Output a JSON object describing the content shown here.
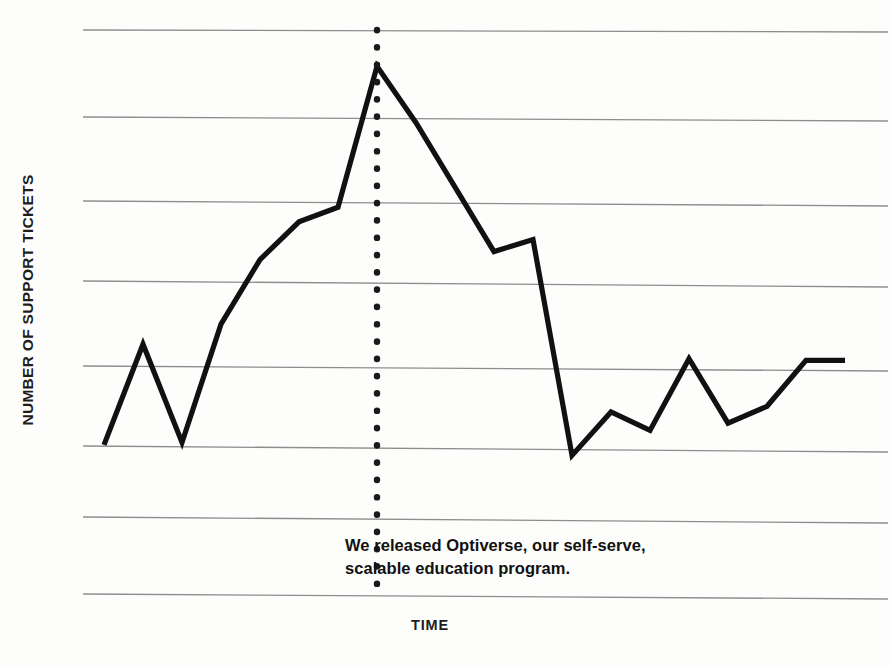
{
  "chart_data": {
    "type": "line",
    "title": "",
    "subtitle": "",
    "xlabel": "TIME",
    "ylabel": "NUMBER OF SUPPORT TICKETS",
    "grid": true,
    "gridlines_horizontal": 8,
    "gridline_values": [
      7,
      6,
      5,
      4,
      3,
      2,
      1,
      0
    ],
    "legend": "none",
    "xlim": [
      0,
      20
    ],
    "ylim": [
      0,
      7.5
    ],
    "axis_tick_labels_x": [],
    "axis_tick_labels_y": [],
    "series": [
      {
        "name": "Number of support tickets",
        "color": "#111111",
        "x": [
          0,
          1,
          2,
          3,
          4,
          5,
          6,
          7,
          8,
          9,
          10,
          11,
          12,
          13,
          14,
          15,
          16,
          17,
          18,
          19
        ],
        "y": [
          1.85,
          3.1,
          1.88,
          3.35,
          4.15,
          4.62,
          4.8,
          6.55,
          5.85,
          5.05,
          4.25,
          4.4,
          1.72,
          2.26,
          2.03,
          2.92,
          2.12,
          2.33,
          2.9,
          2.9
        ]
      }
    ],
    "annotation": {
      "type": "vertical-dotted-marker",
      "x_index": 7,
      "color": "#1a1a1a",
      "lines": [
        "We released Optiverse, our self-serve,",
        "scalable education program."
      ]
    }
  },
  "style": {
    "background_color": "#fdfdfc",
    "gridline_color": "#8f8f8f",
    "line_color": "#111111",
    "text_color": "#1d1d1d"
  }
}
